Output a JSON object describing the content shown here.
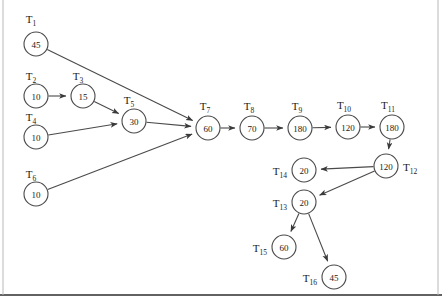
{
  "diagram": {
    "type": "task-dependency-graph",
    "title": "",
    "node_radius": 12,
    "colors": {
      "stroke": "#4a4a4a",
      "node_fill": "#ffffff",
      "text": "#1a1a1a",
      "background": "#ffffff",
      "frame": "#2e2e2e"
    },
    "nodes": [
      {
        "id": "T1",
        "label": "T",
        "sub": "1",
        "value": "45",
        "cx": 36,
        "cy": 44,
        "label_x": 31,
        "label_y": 23,
        "label_anchor": "middle"
      },
      {
        "id": "T2",
        "label": "T",
        "sub": "2",
        "value": "10",
        "cx": 36,
        "cy": 96,
        "label_x": 31,
        "label_y": 80,
        "label_anchor": "middle"
      },
      {
        "id": "T3",
        "label": "T",
        "sub": "3",
        "value": "15",
        "cx": 83,
        "cy": 96,
        "label_x": 78,
        "label_y": 80,
        "label_anchor": "middle"
      },
      {
        "id": "T4",
        "label": "T",
        "sub": "4",
        "value": "10",
        "cx": 36,
        "cy": 137,
        "label_x": 31,
        "label_y": 121,
        "label_anchor": "middle"
      },
      {
        "id": "T5",
        "label": "T",
        "sub": "5",
        "value": "30",
        "cx": 134,
        "cy": 121,
        "label_x": 129,
        "label_y": 104,
        "label_anchor": "middle"
      },
      {
        "id": "T6",
        "label": "T",
        "sub": "6",
        "value": "10",
        "cx": 36,
        "cy": 194,
        "label_x": 31,
        "label_y": 178,
        "label_anchor": "middle"
      },
      {
        "id": "T7",
        "label": "T",
        "sub": "7",
        "value": "60",
        "cx": 208,
        "cy": 128,
        "label_x": 205,
        "label_y": 110,
        "label_anchor": "middle"
      },
      {
        "id": "T8",
        "label": "T",
        "sub": "8",
        "value": "70",
        "cx": 252,
        "cy": 128,
        "label_x": 249,
        "label_y": 110,
        "label_anchor": "middle"
      },
      {
        "id": "T9",
        "label": "T",
        "sub": "9",
        "value": "180",
        "cx": 300,
        "cy": 128,
        "label_x": 297,
        "label_y": 110,
        "label_anchor": "middle"
      },
      {
        "id": "T10",
        "label": "T",
        "sub": "10",
        "value": "120",
        "cx": 348,
        "cy": 127,
        "label_x": 344,
        "label_y": 109,
        "label_anchor": "middle"
      },
      {
        "id": "T11",
        "label": "T",
        "sub": "11",
        "value": "180",
        "cx": 392,
        "cy": 127,
        "label_x": 388,
        "label_y": 109,
        "label_anchor": "middle"
      },
      {
        "id": "T12",
        "label": "T",
        "sub": "12",
        "value": "120",
        "cx": 386,
        "cy": 166,
        "label_x": 403,
        "label_y": 171,
        "label_anchor": "start"
      },
      {
        "id": "T13",
        "label": "T",
        "sub": "13",
        "value": "20",
        "cx": 304,
        "cy": 202,
        "label_x": 287,
        "label_y": 207,
        "label_anchor": "end"
      },
      {
        "id": "T14",
        "label": "T",
        "sub": "14",
        "value": "20",
        "cx": 304,
        "cy": 170,
        "label_x": 287,
        "label_y": 175,
        "label_anchor": "end"
      },
      {
        "id": "T15",
        "label": "T",
        "sub": "15",
        "value": "60",
        "cx": 284,
        "cy": 247,
        "label_x": 267,
        "label_y": 252,
        "label_anchor": "end"
      },
      {
        "id": "T16",
        "label": "T",
        "sub": "16",
        "value": "45",
        "cx": 334,
        "cy": 277,
        "label_x": 317,
        "label_y": 282,
        "label_anchor": "end"
      }
    ],
    "edges": [
      {
        "from": "T1",
        "to": "T7"
      },
      {
        "from": "T2",
        "to": "T3"
      },
      {
        "from": "T3",
        "to": "T5"
      },
      {
        "from": "T4",
        "to": "T5"
      },
      {
        "from": "T5",
        "to": "T7"
      },
      {
        "from": "T6",
        "to": "T7"
      },
      {
        "from": "T7",
        "to": "T8"
      },
      {
        "from": "T8",
        "to": "T9"
      },
      {
        "from": "T9",
        "to": "T10"
      },
      {
        "from": "T10",
        "to": "T11"
      },
      {
        "from": "T11",
        "to": "T12"
      },
      {
        "from": "T12",
        "to": "T14"
      },
      {
        "from": "T12",
        "to": "T13"
      },
      {
        "from": "T13",
        "to": "T15"
      },
      {
        "from": "T13",
        "to": "T16"
      }
    ],
    "frame": {
      "bottom_y": 295,
      "left_x": 3,
      "right_x": 438
    }
  }
}
